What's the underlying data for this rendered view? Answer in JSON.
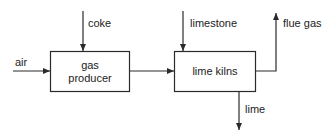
{
  "diagram": {
    "type": "process-flow",
    "nodes": [
      {
        "id": "gas_producer",
        "line1": "gas",
        "line2": "producer"
      },
      {
        "id": "lime_kilns",
        "label": "lime kilns"
      }
    ],
    "inputs": {
      "coke": "coke",
      "air": "air",
      "limestone": "limestone"
    },
    "outputs": {
      "flue_gas": "flue gas",
      "lime": "lime"
    },
    "edges": [
      {
        "from": "coke",
        "to": "gas_producer"
      },
      {
        "from": "air",
        "to": "gas_producer"
      },
      {
        "from": "gas_producer",
        "to": "lime_kilns"
      },
      {
        "from": "limestone",
        "to": "lime_kilns"
      },
      {
        "from": "lime_kilns",
        "to": "flue_gas"
      },
      {
        "from": "lime_kilns",
        "to": "lime"
      }
    ],
    "colors": {
      "line": "#2a2a2a",
      "background": "#ffffff"
    }
  }
}
